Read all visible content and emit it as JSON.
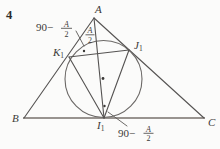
{
  "figure": {
    "number": "4",
    "vertices": {
      "a": "A",
      "b": "B",
      "c": "C"
    },
    "points": {
      "k1": {
        "base": "K",
        "sub": "1"
      },
      "j1": {
        "base": "J",
        "sub": "1"
      },
      "i1": {
        "base": "I",
        "sub": "1"
      }
    },
    "annotations": {
      "apex_half_angle": {
        "num": "A",
        "den": "2"
      },
      "left": {
        "prefix": "90−",
        "num": "A",
        "den": "2"
      },
      "bottom": {
        "prefix": "90−",
        "num": "A",
        "den": "2"
      }
    },
    "colors": {
      "line": "#555352",
      "baseline": "#98938f",
      "circle": "#6b6866",
      "text": "#3c3a38",
      "background": "#fbfbfa"
    }
  }
}
